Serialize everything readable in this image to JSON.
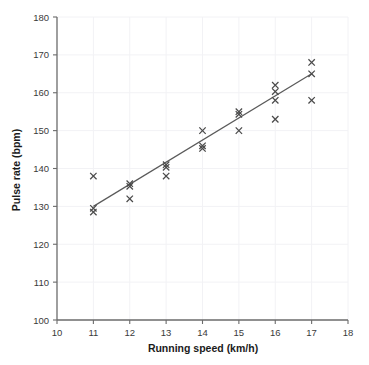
{
  "chart_data": {
    "type": "scatter",
    "title": "",
    "xlabel": "Running speed (km/h)",
    "ylabel": "Pulse rate (bpm)",
    "xlim": [
      10,
      18
    ],
    "ylim": [
      100,
      180
    ],
    "xticks": [
      10,
      11,
      12,
      13,
      14,
      15,
      16,
      17,
      18
    ],
    "yticks": [
      100,
      110,
      120,
      130,
      140,
      150,
      160,
      170,
      180
    ],
    "xtick_labels": [
      "10",
      "11",
      "12",
      "13",
      "14",
      "15",
      "16",
      "17",
      "18"
    ],
    "ytick_labels": [
      "100",
      "110",
      "120",
      "130",
      "140",
      "150",
      "160",
      "170",
      "180"
    ],
    "grid": true,
    "legend": "none",
    "marker": "x",
    "marker_color": "#4a4a4a",
    "points": [
      {
        "x": 11,
        "y": 138
      },
      {
        "x": 11,
        "y": 129.5
      },
      {
        "x": 11,
        "y": 128.5
      },
      {
        "x": 12,
        "y": 136
      },
      {
        "x": 12,
        "y": 135.3
      },
      {
        "x": 12,
        "y": 132
      },
      {
        "x": 13,
        "y": 141
      },
      {
        "x": 13,
        "y": 140.3
      },
      {
        "x": 13,
        "y": 138
      },
      {
        "x": 14,
        "y": 150
      },
      {
        "x": 14,
        "y": 146
      },
      {
        "x": 14,
        "y": 145.3
      },
      {
        "x": 15,
        "y": 155
      },
      {
        "x": 15,
        "y": 154.3
      },
      {
        "x": 15,
        "y": 150
      },
      {
        "x": 16,
        "y": 162
      },
      {
        "x": 16,
        "y": 160.3
      },
      {
        "x": 16,
        "y": 158
      },
      {
        "x": 16,
        "y": 153
      },
      {
        "x": 17,
        "y": 168
      },
      {
        "x": 17,
        "y": 165
      },
      {
        "x": 17,
        "y": 158
      }
    ],
    "trendline": {
      "label": "line of best fit",
      "x0": 11,
      "y0": 130,
      "x1": 17,
      "y1": 165,
      "color": "#5a5a5a"
    }
  }
}
